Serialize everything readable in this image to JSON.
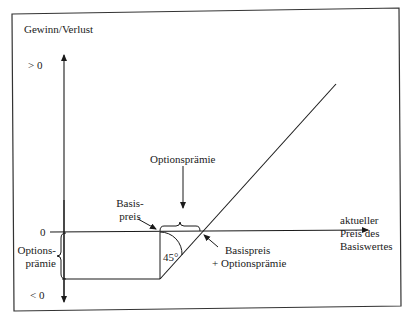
{
  "diagram": {
    "type": "payoff-diagram",
    "y_axis": {
      "title": "Gewinn/Verlust",
      "positive_label": "> 0",
      "zero_label": "0",
      "negative_label": "< 0"
    },
    "x_axis": {
      "label_line1": "aktueller",
      "label_line2": "Preis des",
      "label_line3": "Basiswertes"
    },
    "annotations": {
      "strike_line1": "Basis-",
      "strike_line2": "preis",
      "premium_top": "Optionsprämie",
      "premium_left_line1": "Options-",
      "premium_left_line2": "prämie",
      "angle": "45°",
      "breakeven_line1": "Basispreis",
      "breakeven_line2": "+ Optionsprämie"
    },
    "colors": {
      "line": "#1a1a1a",
      "frame": "#333333",
      "background": "#ffffff"
    }
  }
}
